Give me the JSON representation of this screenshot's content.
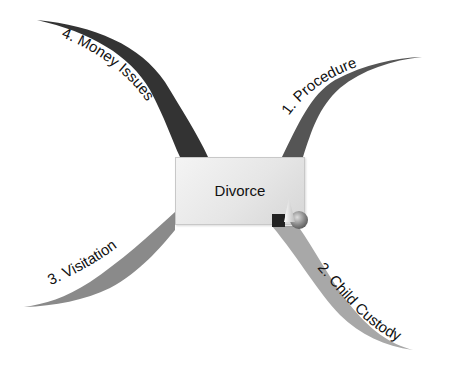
{
  "diagram": {
    "type": "mind-map",
    "center": {
      "label": "Divorce"
    },
    "branches": [
      {
        "id": 1,
        "label": "1. Procedure",
        "color": "#555555",
        "direction": "upper-right"
      },
      {
        "id": 2,
        "label": "2. Child Custody",
        "color": "#a8a8a8",
        "direction": "lower-right"
      },
      {
        "id": 3,
        "label": "3. Visitation",
        "color": "#8a8a8a",
        "direction": "lower-left"
      },
      {
        "id": 4,
        "label": "4. Money Issues",
        "color": "#333333",
        "direction": "upper-left"
      }
    ],
    "icons": {
      "center_decoration": "3d-shapes-icon"
    }
  }
}
